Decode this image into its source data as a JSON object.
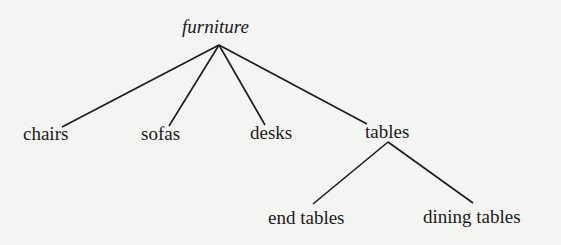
{
  "diagram": {
    "type": "tree",
    "root": {
      "label": "furniture",
      "children": [
        {
          "label": "chairs"
        },
        {
          "label": "sofas"
        },
        {
          "label": "desks"
        },
        {
          "label": "tables",
          "children": [
            {
              "label": "end tables"
            },
            {
              "label": "dining tables"
            }
          ]
        }
      ]
    }
  },
  "labels": {
    "root": "furniture",
    "chairs": "chairs",
    "sofas": "sofas",
    "desks": "desks",
    "tables": "tables",
    "end_tables": "end tables",
    "dining_tables": "dining tables"
  },
  "colors": {
    "background": "#f4f4f2",
    "ink": "#1a1a1a"
  }
}
